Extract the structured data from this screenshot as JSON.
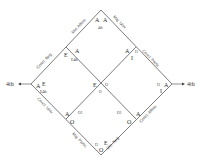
{
  "diagram": {
    "type": "logic-diamond",
    "edge_labels": {
      "top_left": "Min. Affirm",
      "top_right": "Maj. Univ.",
      "upper_left": "Concl. Neg.",
      "upper_right": "Concl. Partic.",
      "lower_left": "Concl. Univ.",
      "lower_right": "Concl. Affirm",
      "bottom_left": "Maj. Partic.",
      "bottom_right": "Min. Neg."
    },
    "arrows": {
      "left": "4th",
      "right": "4th"
    },
    "vertex_labels": {
      "top_a1": "A",
      "top_a2": "A",
      "top_4th": "4th",
      "ul_e": "E",
      "ul_a": "A",
      "ul_e4th": "E4th",
      "ur_a": "A",
      "ur_i1": "I1",
      "ur_i": "I",
      "left_a": "A",
      "left_e": "E",
      "left_e4th": "E4th",
      "center_e": "E",
      "center_i": "I3",
      "center_o": "O",
      "right_i3": "I3",
      "right_a": "A",
      "right_i": "I",
      "bl_a": "A",
      "bl_o": "O",
      "bl_o3": "O3",
      "br_o3": "O3",
      "br_o": "O",
      "br_a": "A",
      "bottom_i3": "I3",
      "bottom_e": "E",
      "bottom_o": "O"
    }
  }
}
